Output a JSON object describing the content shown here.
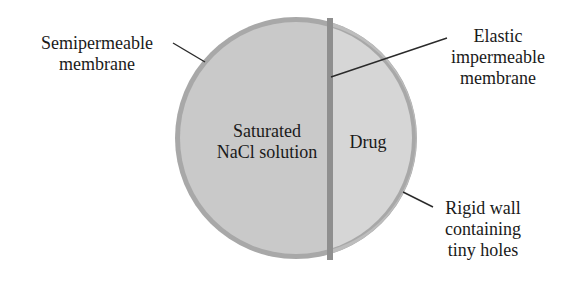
{
  "diagram": {
    "labels": {
      "semipermeable": [
        "Semipermeable",
        "membrane"
      ],
      "elastic": [
        "Elastic",
        "impermeable",
        "membrane"
      ],
      "rigid_wall": [
        "Rigid wall",
        "containing",
        "tiny holes"
      ],
      "saturated": [
        "Saturated",
        "NaCl solution"
      ],
      "drug": [
        "Drug"
      ]
    },
    "colors": {
      "outer_ring": "#a8a8a8",
      "nacl_fill": "#c9c9c9",
      "drug_fill": "#d6d6d6",
      "divider": "#8f8f8f",
      "leader_line": "#2a2a2a",
      "text": "#1a1a1a",
      "background": "#ffffff"
    }
  }
}
